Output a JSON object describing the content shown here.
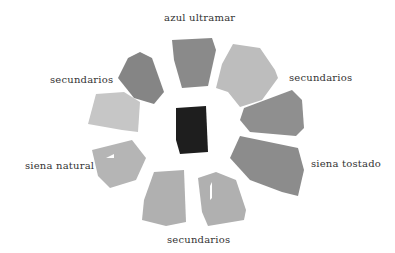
{
  "labels": {
    "top": "azul ultramar",
    "upper_left": "secundarios",
    "upper_right": "secundarios",
    "left": "siena natural",
    "right": "siena tostado",
    "bottom": "secundarios"
  },
  "swatches": [
    {
      "name": "top",
      "color": "#8a8a8a"
    },
    {
      "name": "upper-right",
      "color": "#bdbdbd"
    },
    {
      "name": "right-upper",
      "color": "#8f8f8f"
    },
    {
      "name": "right-lower",
      "color": "#8c8c8c"
    },
    {
      "name": "bottom-right",
      "color": "#b0b0b0"
    },
    {
      "name": "bottom-left",
      "color": "#b0b0b0"
    },
    {
      "name": "left-lower",
      "color": "#b5b5b5"
    },
    {
      "name": "left-upper",
      "color": "#c6c6c6"
    },
    {
      "name": "upper-left",
      "color": "#858585"
    },
    {
      "name": "center",
      "color": "#1e1e1e"
    }
  ]
}
